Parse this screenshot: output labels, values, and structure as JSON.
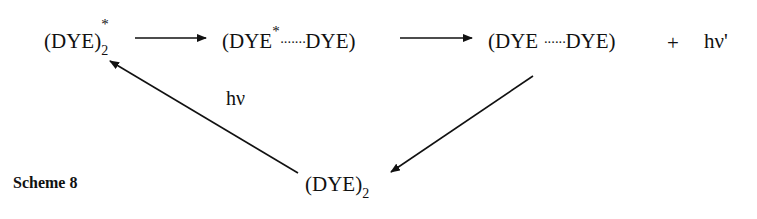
{
  "scheme": {
    "caption": "Scheme 8",
    "species": {
      "excited_dimer": {
        "base": "(DYE)",
        "subscript": "2",
        "superscript": "*"
      },
      "excimer_left": {
        "open": "(DYE",
        "superscript": "*",
        "dots": "·······",
        "close": "DYE)"
      },
      "ground_pair": {
        "open": "(DYE",
        "dots": "······",
        "close": "DYE)"
      },
      "plus": "+",
      "emission": "hν'",
      "ground_dimer": {
        "base": "(DYE)",
        "subscript": "2"
      }
    },
    "arrows": [
      {
        "from": "excited_dimer",
        "to": "excimer_left",
        "label": ""
      },
      {
        "from": "excimer_left",
        "to": "ground_pair",
        "label": ""
      },
      {
        "from": "ground_pair",
        "to": "ground_dimer",
        "label": ""
      },
      {
        "from": "ground_dimer",
        "to": "excited_dimer",
        "label": "hν"
      }
    ],
    "colors": {
      "ink": "#111111",
      "background": "#ffffff"
    }
  }
}
